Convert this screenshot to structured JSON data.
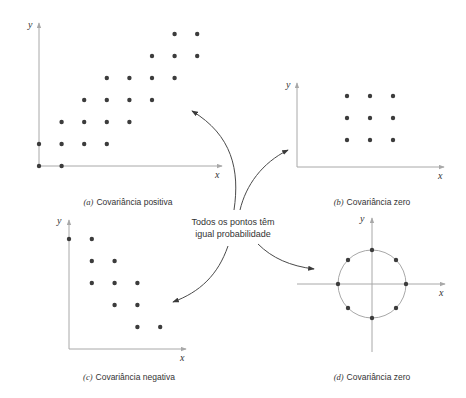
{
  "chart_data": [
    {
      "type": "scatter",
      "id": "a",
      "title": "Covariância positiva",
      "tag": "(a)",
      "xlabel": "x",
      "ylabel": "y",
      "points": [
        [
          0,
          0
        ],
        [
          1,
          0
        ],
        [
          0,
          1
        ],
        [
          1,
          1
        ],
        [
          2,
          1
        ],
        [
          3,
          1
        ],
        [
          1,
          2
        ],
        [
          2,
          2
        ],
        [
          3,
          2
        ],
        [
          4,
          2
        ],
        [
          2,
          3
        ],
        [
          3,
          3
        ],
        [
          4,
          3
        ],
        [
          5,
          3
        ],
        [
          3,
          4
        ],
        [
          4,
          4
        ],
        [
          5,
          4
        ],
        [
          6,
          4
        ],
        [
          5,
          5
        ],
        [
          6,
          5
        ],
        [
          7,
          5
        ],
        [
          6,
          6
        ],
        [
          7,
          6
        ]
      ]
    },
    {
      "type": "scatter",
      "id": "b",
      "title": "Covariância zero",
      "tag": "(b)",
      "xlabel": "x",
      "ylabel": "y",
      "points": [
        [
          1,
          1
        ],
        [
          2,
          1
        ],
        [
          3,
          1
        ],
        [
          1,
          2
        ],
        [
          2,
          2
        ],
        [
          3,
          2
        ],
        [
          1,
          3
        ],
        [
          2,
          3
        ],
        [
          3,
          3
        ]
      ]
    },
    {
      "type": "scatter",
      "id": "c",
      "title": "Covariância negativa",
      "tag": "(c)",
      "xlabel": "x",
      "ylabel": "y",
      "points": [
        [
          0,
          5
        ],
        [
          1,
          5
        ],
        [
          1,
          4
        ],
        [
          2,
          4
        ],
        [
          1,
          3
        ],
        [
          2,
          3
        ],
        [
          3,
          3
        ],
        [
          2,
          2
        ],
        [
          3,
          2
        ],
        [
          3,
          1
        ],
        [
          4,
          1
        ]
      ]
    },
    {
      "type": "scatter",
      "id": "d",
      "title": "Covariância zero",
      "tag": "(d)",
      "xlabel": "x",
      "ylabel": "y",
      "points": [
        [
          1,
          0
        ],
        [
          0.707,
          0.707
        ],
        [
          0,
          1
        ],
        [
          -0.707,
          0.707
        ],
        [
          -1,
          0
        ],
        [
          -0.707,
          -0.707
        ],
        [
          0,
          -1
        ],
        [
          0.707,
          -0.707
        ]
      ],
      "note": "8 points equally spaced on a unit circle centered at origin"
    }
  ],
  "center_label": {
    "line1": "Todos os pontos têm",
    "line2": "igual probabilidade"
  },
  "captions": {
    "a": {
      "tag": "(a)",
      "text": "Covariância positiva"
    },
    "b": {
      "tag": "(b)",
      "text": "Covariância zero"
    },
    "c": {
      "tag": "(c)",
      "text": "Covariância negativa"
    },
    "d": {
      "tag": "(d)",
      "text": "Covariância zero"
    }
  },
  "axis_labels": {
    "x": "x",
    "y": "y"
  }
}
